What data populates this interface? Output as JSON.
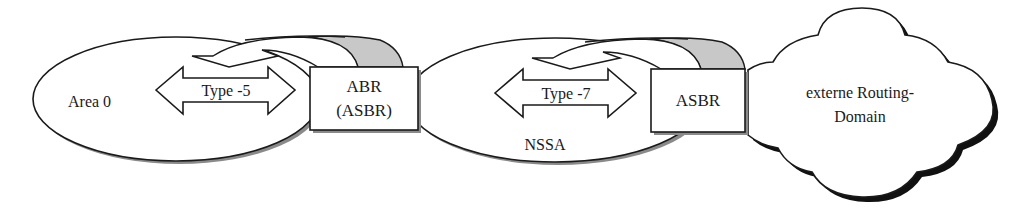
{
  "diagram": {
    "colors": {
      "stroke": "#1a1a1a",
      "shadow": "#8a8a8a",
      "band_fill": "#c8c8c8",
      "fill": "#ffffff"
    },
    "nodes": {
      "area0": {
        "label": "Area 0"
      },
      "abr": {
        "line1": "ABR",
        "line2": "(ASBR)"
      },
      "nssa": {
        "label": "NSSA"
      },
      "asbr": {
        "label": "ASBR"
      },
      "external": {
        "line1": "externe Routing-",
        "line2": "Domain"
      }
    },
    "arrows": {
      "type5": {
        "label": "Type -5"
      },
      "type7": {
        "label": "Type -7"
      }
    }
  }
}
